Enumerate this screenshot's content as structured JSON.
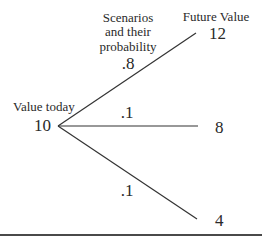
{
  "diagram": {
    "headers": {
      "scenarios_line1": "Scenarios",
      "scenarios_line2": "and their",
      "scenarios_line3": "probability",
      "future_value": "Future Value"
    },
    "root": {
      "label": "Value today",
      "value": "10"
    },
    "branches": [
      {
        "probability": ".8",
        "future_value": "12"
      },
      {
        "probability": ".1",
        "future_value": "8"
      },
      {
        "probability": ".1",
        "future_value": "4"
      }
    ],
    "colors": {
      "line": "#333333",
      "text": "#2a2a2a",
      "rule": "#4a4a4a"
    }
  }
}
